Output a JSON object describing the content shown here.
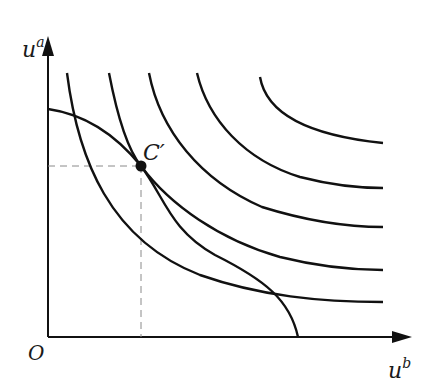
{
  "diagram": {
    "type": "utility-possibility-frontier-with-social-indifference-curves",
    "axes": {
      "y_label": "u",
      "y_label_sup": "a",
      "x_label": "u",
      "x_label_sup": "b",
      "origin_label": "O"
    },
    "point": {
      "label": "C′",
      "description": "tangency of frontier with social indifference curve"
    },
    "colors": {
      "stroke": "#111111",
      "dashed": "#8a8a8a",
      "background": "#ffffff"
    },
    "curves": {
      "frontier": "utility possibility frontier",
      "indifference_count": 5
    }
  }
}
